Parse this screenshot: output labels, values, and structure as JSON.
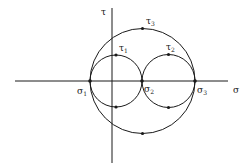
{
  "diagram": {
    "type": "mohr-circles",
    "axes": {
      "x_label": "σ",
      "y_label": "τ"
    },
    "points": {
      "sigma1": {
        "label": "σ",
        "sub": "1"
      },
      "sigma2": {
        "label": "σ",
        "sub": "2"
      },
      "sigma3": {
        "label": "σ",
        "sub": "3"
      },
      "tau1": {
        "label": "τ",
        "sub": "1"
      },
      "tau2": {
        "label": "τ",
        "sub": "2"
      },
      "tau3": {
        "label": "τ",
        "sub": "3"
      }
    },
    "circles": [
      {
        "name": "circle-sigma1-sigma2",
        "cx": 116,
        "cy": 81,
        "r": 26
      },
      {
        "name": "circle-sigma2-sigma3",
        "cx": 168.5,
        "cy": 81,
        "r": 26.5
      },
      {
        "name": "circle-sigma1-sigma3",
        "cx": 142.5,
        "cy": 81,
        "r": 52.5
      }
    ],
    "colors": {
      "stroke": "#1a1a1a",
      "background": "#ffffff"
    }
  }
}
